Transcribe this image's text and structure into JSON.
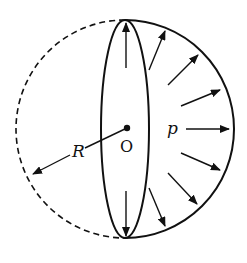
{
  "diagram": {
    "colors": {
      "stroke": "#111111",
      "background": "#ffffff"
    },
    "geometry": {
      "center": [
        127,
        129
      ],
      "radius": 109,
      "top": [
        125,
        20
      ],
      "bottom": [
        125,
        238
      ],
      "disk_half_width": 25
    },
    "labels": {
      "radius": "R",
      "center": "O",
      "pressure": "p"
    },
    "elements": [
      {
        "name": "solid-right-hemisphere-arc",
        "style": "solid"
      },
      {
        "name": "dashed-left-hemisphere-arc",
        "style": "dashed"
      },
      {
        "name": "cross-section-ellipse",
        "style": "solid"
      },
      {
        "name": "center-point",
        "style": "filled-dot"
      },
      {
        "name": "radius-arrow",
        "style": "arrow",
        "label": "R"
      },
      {
        "name": "pressure-arrows",
        "count": 8,
        "label": "p"
      },
      {
        "name": "vertical-stress-arrows",
        "count": 2
      }
    ]
  }
}
